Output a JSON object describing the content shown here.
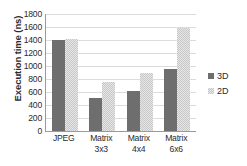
{
  "chart_data": {
    "type": "bar",
    "title": "",
    "xlabel": "",
    "ylabel": "Execution time (ns)",
    "ylim": [
      0,
      1800
    ],
    "ytick_step": 200,
    "yticks": [
      1800,
      1600,
      1400,
      1200,
      1000,
      800,
      600,
      400,
      200,
      0
    ],
    "grid": true,
    "legend_position": "right",
    "categories": [
      "JPEG",
      "Matrix 3x3",
      "Matrix 4x4",
      "Matrix 6x6"
    ],
    "category_lines": [
      [
        "JPEG",
        ""
      ],
      [
        "Matrix",
        "3x3"
      ],
      [
        "Matrix",
        "4x4"
      ],
      [
        "Matrix",
        "6x6"
      ]
    ],
    "series": [
      {
        "name": "3D",
        "color": "#6e6e6e",
        "values": [
          1400,
          510,
          620,
          960
        ]
      },
      {
        "name": "2D",
        "color": "#d8d8d8",
        "values": [
          1415,
          760,
          890,
          1580
        ]
      }
    ]
  },
  "legend": {
    "items": [
      {
        "label": "3D"
      },
      {
        "label": "2D"
      }
    ]
  }
}
